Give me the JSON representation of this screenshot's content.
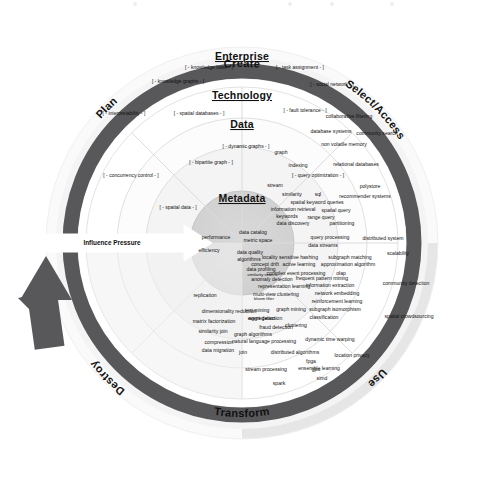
{
  "diagram": {
    "title_visible": false,
    "type": "concentric-lifecycle-wheel",
    "colors": {
      "dark_ring": "#58585a",
      "halo_light": "#efefef",
      "halo_dark": "#9a9a9c",
      "ring_enterprise": "#ffffff",
      "ring_technology": "#fbfbfb",
      "ring_data": "#f3f3f3",
      "core_metadata": "#d3d3d3",
      "arrow_fill": "#ffffff",
      "arrow_up_fill": "#58585a",
      "text": "#111111"
    }
  },
  "lifecycle": {
    "label_top": "Create",
    "label_right": "Select/Access",
    "label_bottom": "Transform",
    "label_left_lower": "Destroy",
    "label_left_upper": "Plan",
    "label_right_lower": "Use"
  },
  "rings": {
    "enterprise": {
      "label": "Enterprise"
    },
    "technology": {
      "label": "Technology"
    },
    "data": {
      "label": "Data"
    },
    "metadata": {
      "label": "Metadata"
    }
  },
  "arrows": {
    "influence_pressure": "Influence Pressure"
  },
  "bracket_terms": {
    "enterprise": [
      {
        "text": "[ - knowledge base - ]",
        "x": 209,
        "y": 69
      },
      {
        "text": "[ - task assignment - ]",
        "x": 300,
        "y": 69
      },
      {
        "text": "[ - knowledge graphs - ]",
        "x": 178,
        "y": 83
      },
      {
        "text": "[ - social network - ]",
        "x": 332,
        "y": 86
      }
    ],
    "technology": [
      {
        "text": "[ - interpretability - ]",
        "x": 124,
        "y": 115
      },
      {
        "text": "[ - spatial databases - ]",
        "x": 199,
        "y": 115
      },
      {
        "text": "[ - fault tolerance - ]",
        "x": 305,
        "y": 112
      },
      {
        "text": "[ - concurrency control - ]",
        "x": 131,
        "y": 177
      },
      {
        "text": "[ - spatial data - ]",
        "x": 178,
        "y": 209
      }
    ],
    "data": [
      {
        "text": "[ - dynamic graphs - ]",
        "x": 246,
        "y": 148
      },
      {
        "text": "[ - bipartite graph - ]",
        "x": 211,
        "y": 164
      },
      {
        "text": "[ - query optimization - ]",
        "x": 318,
        "y": 177
      }
    ]
  },
  "terms": {
    "technology_ring": [
      {
        "text": "collaborative filtering",
        "x": 349,
        "y": 118,
        "size": "tag"
      },
      {
        "text": "database systems",
        "x": 331,
        "y": 133,
        "size": "tag"
      },
      {
        "text": "community search",
        "x": 377,
        "y": 135,
        "size": "tag"
      },
      {
        "text": "non volatile memory",
        "x": 344,
        "y": 146,
        "size": "tag"
      },
      {
        "text": "relational databases",
        "x": 356,
        "y": 166,
        "size": "tag"
      },
      {
        "text": "polystore",
        "x": 370,
        "y": 188,
        "size": "tag"
      },
      {
        "text": "recommender systems",
        "x": 365,
        "y": 198,
        "size": "tag"
      },
      {
        "text": "distributed system",
        "x": 383,
        "y": 240,
        "size": "tag"
      },
      {
        "text": "scalability",
        "x": 398,
        "y": 255,
        "size": "tag"
      },
      {
        "text": "community detection",
        "x": 406,
        "y": 285,
        "size": "tag"
      },
      {
        "text": "spatial crowdsourcing",
        "x": 409,
        "y": 318,
        "size": "tag"
      },
      {
        "text": "location privacy",
        "x": 352,
        "y": 357,
        "size": "tag"
      },
      {
        "text": "ensemble learning",
        "x": 319,
        "y": 370,
        "size": "tag"
      },
      {
        "text": "distributed algorithms",
        "x": 295,
        "y": 354,
        "size": "tag"
      },
      {
        "text": "stream processing",
        "x": 266,
        "y": 371,
        "size": "tag"
      },
      {
        "text": "spark",
        "x": 279,
        "y": 385,
        "size": "tag"
      },
      {
        "text": "simd",
        "x": 322,
        "y": 380,
        "size": "tag"
      },
      {
        "text": "gpu",
        "x": 316,
        "y": 371,
        "size": "tag"
      },
      {
        "text": "fpga",
        "x": 311,
        "y": 363,
        "size": "tag"
      },
      {
        "text": "join",
        "x": 243,
        "y": 354,
        "size": "tag"
      },
      {
        "text": "compression",
        "x": 219,
        "y": 344,
        "size": "tag"
      },
      {
        "text": "data migration",
        "x": 218,
        "y": 352,
        "size": "tag"
      },
      {
        "text": "similarity join",
        "x": 213,
        "y": 333,
        "size": "tag"
      },
      {
        "text": "matrix factorization",
        "x": 214,
        "y": 323,
        "size": "tag"
      },
      {
        "text": "dimensionality reduction",
        "x": 229,
        "y": 313,
        "size": "tag"
      },
      {
        "text": "replication",
        "x": 205,
        "y": 297,
        "size": "tag"
      },
      {
        "text": "aggregation",
        "x": 262,
        "y": 320,
        "size": "tag"
      },
      {
        "text": "natural language processing",
        "x": 264,
        "y": 343,
        "size": "tag"
      },
      {
        "text": "graph algorithms",
        "x": 253,
        "y": 336,
        "size": "tag"
      },
      {
        "text": "dynamic time warping",
        "x": 330,
        "y": 341,
        "size": "tag"
      },
      {
        "text": "clustering",
        "x": 296,
        "y": 327,
        "size": "tag"
      },
      {
        "text": "classification",
        "x": 324,
        "y": 319,
        "size": "tag"
      },
      {
        "text": "fraud detection",
        "x": 276,
        "y": 329,
        "size": "tag"
      },
      {
        "text": "event detection",
        "x": 265,
        "y": 320,
        "size": "tag"
      },
      {
        "text": "text mining",
        "x": 257,
        "y": 312,
        "size": "tag"
      },
      {
        "text": "graph mining",
        "x": 291,
        "y": 311,
        "size": "tag"
      },
      {
        "text": "subgraph isomorphism",
        "x": 335,
        "y": 311,
        "size": "tag"
      },
      {
        "text": "reinforcement learning",
        "x": 337,
        "y": 303,
        "size": "tag"
      },
      {
        "text": "network embedding",
        "x": 337,
        "y": 295,
        "size": "tag"
      },
      {
        "text": "information extraction",
        "x": 330,
        "y": 287,
        "size": "tag"
      },
      {
        "text": "representation learning",
        "x": 284,
        "y": 288,
        "size": "tag"
      },
      {
        "text": "multi-view clustering",
        "x": 276,
        "y": 296,
        "size": "tag"
      },
      {
        "text": "bloom filter",
        "x": 264,
        "y": 300,
        "size": "xs"
      },
      {
        "text": "anomaly detection",
        "x": 272,
        "y": 281,
        "size": "tag"
      },
      {
        "text": "frequent pattern mining",
        "x": 322,
        "y": 280,
        "size": "tag"
      },
      {
        "text": "similarity search",
        "x": 262,
        "y": 276,
        "size": "xs"
      },
      {
        "text": "complex event processing",
        "x": 296,
        "y": 275,
        "size": "tag"
      },
      {
        "text": "olap",
        "x": 341,
        "y": 275,
        "size": "tag"
      },
      {
        "text": "data profiling",
        "x": 261,
        "y": 271,
        "size": "tag"
      },
      {
        "text": "concept drift",
        "x": 265,
        "y": 266,
        "size": "tag"
      },
      {
        "text": "active learning",
        "x": 299,
        "y": 266,
        "size": "tag"
      },
      {
        "text": "approximation algorithm",
        "x": 348,
        "y": 266,
        "size": "tag"
      },
      {
        "text": "locality sensitive hashing",
        "x": 290,
        "y": 259,
        "size": "tag"
      },
      {
        "text": "subgraph matching",
        "x": 350,
        "y": 259,
        "size": "tag"
      },
      {
        "text": "data streams",
        "x": 323,
        "y": 247,
        "size": "tag"
      }
    ],
    "data_ring": [
      {
        "text": "graph",
        "x": 281,
        "y": 154,
        "size": "tag"
      },
      {
        "text": "indexing",
        "x": 298,
        "y": 167,
        "size": "tag"
      },
      {
        "text": "stream",
        "x": 275,
        "y": 187,
        "size": "tag"
      },
      {
        "text": "similarity",
        "x": 292,
        "y": 196,
        "size": "tag"
      },
      {
        "text": "sql",
        "x": 318,
        "y": 196,
        "size": "tag"
      },
      {
        "text": "spatial keyword queries",
        "x": 317,
        "y": 204,
        "size": "tag"
      },
      {
        "text": "information retrieval",
        "x": 293,
        "y": 211,
        "size": "tag"
      },
      {
        "text": "spatial query",
        "x": 336,
        "y": 212,
        "size": "tag"
      },
      {
        "text": "keywords",
        "x": 287,
        "y": 218,
        "size": "tag"
      },
      {
        "text": "range query",
        "x": 321,
        "y": 219,
        "size": "tag"
      },
      {
        "text": "data discovery",
        "x": 293,
        "y": 225,
        "size": "tag"
      },
      {
        "text": "partitioning",
        "x": 342,
        "y": 225,
        "size": "tag"
      },
      {
        "text": "query processing",
        "x": 330,
        "y": 239,
        "size": "tag"
      }
    ],
    "metadata_core": [
      {
        "text": "data catalog",
        "x": 253,
        "y": 234,
        "size": "tag"
      },
      {
        "text": "metric space",
        "x": 258,
        "y": 242,
        "size": "tag"
      },
      {
        "text": "performance",
        "x": 216,
        "y": 239,
        "size": "tag"
      },
      {
        "text": "efficiency",
        "x": 209,
        "y": 252,
        "size": "tag"
      },
      {
        "text": "data quality",
        "x": 250,
        "y": 254,
        "size": "tag"
      },
      {
        "text": "algorithms",
        "x": 249,
        "y": 261,
        "size": "tag"
      }
    ]
  },
  "top_noise_marks": [
    {
      "x": 133,
      "y": 2
    },
    {
      "x": 288,
      "y": 2
    },
    {
      "x": 330,
      "y": 2
    },
    {
      "x": 390,
      "y": 2
    }
  ]
}
